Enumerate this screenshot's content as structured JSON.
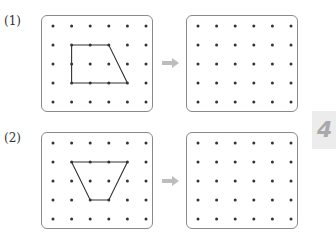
{
  "problems": [
    {
      "label": "(1)",
      "grid": {
        "cols": 6,
        "rows": 5
      },
      "shape": {
        "name": "trapezoid",
        "points": [
          [
            1,
            1
          ],
          [
            3,
            1
          ],
          [
            4,
            3
          ],
          [
            1,
            3
          ]
        ],
        "marked_dots": [
          [
            1,
            1
          ],
          [
            2,
            1
          ],
          [
            3,
            1
          ],
          [
            1,
            2
          ],
          [
            1,
            3
          ],
          [
            2,
            3
          ],
          [
            3,
            3
          ],
          [
            4,
            3
          ]
        ]
      },
      "target_grid": {
        "cols": 6,
        "rows": 5
      }
    },
    {
      "label": "(2)",
      "grid": {
        "cols": 6,
        "rows": 5
      },
      "shape": {
        "name": "trapezoid",
        "points": [
          [
            1,
            1
          ],
          [
            4,
            1
          ],
          [
            3,
            3
          ],
          [
            2,
            3
          ]
        ],
        "marked_dots": [
          [
            1,
            1
          ],
          [
            2,
            1
          ],
          [
            3,
            1
          ],
          [
            4,
            1
          ],
          [
            2,
            3
          ],
          [
            3,
            3
          ]
        ]
      },
      "target_grid": {
        "cols": 6,
        "rows": 5
      }
    }
  ],
  "arrow_icon": "right-arrow-icon",
  "chapter_tab": {
    "text": "4"
  },
  "colors": {
    "border": "#8a8a8a",
    "dot": "#333333",
    "line": "#333333",
    "arrow": "#bdbdbd",
    "tab_bg": "#ececec",
    "tab_text": "#a9a9a9"
  }
}
